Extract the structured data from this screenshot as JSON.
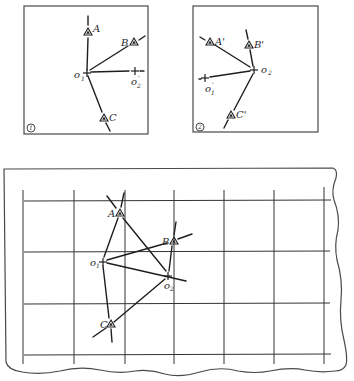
{
  "panel1": {
    "number": "1",
    "points": {
      "A": {
        "label": "A"
      },
      "B": {
        "label": "B"
      },
      "C": {
        "label": "C"
      },
      "o1": {
        "label": "o",
        "sub": "1"
      },
      "o2p": {
        "label": "o",
        "sub": "2",
        "prime": "'"
      }
    }
  },
  "panel2": {
    "number": "2",
    "points": {
      "A": {
        "label": "A'"
      },
      "B": {
        "label": "B'"
      },
      "C": {
        "label": "C'"
      },
      "o2": {
        "label": "o",
        "sub": "2"
      },
      "o1p": {
        "label": "o",
        "sub": "1",
        "prime": "'"
      }
    }
  },
  "map": {
    "points": {
      "A": {
        "label": "A"
      },
      "B": {
        "label": "B"
      },
      "C": {
        "label": "C"
      },
      "o1": {
        "label": "o",
        "sub": "1"
      },
      "o2": {
        "label": "o",
        "sub": "2"
      }
    }
  }
}
